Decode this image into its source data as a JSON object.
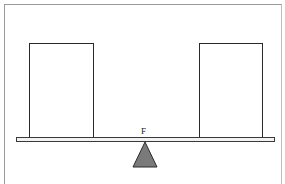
{
  "diagram": {
    "fulcrum_label": "F",
    "colors": {
      "background": "#ffffff",
      "outline": "#2a2a2a",
      "fulcrum_fill": "#7a7a7a",
      "beam_fill": "#f2f2f2",
      "frame": "#9a9a9a"
    },
    "elements": {
      "left_box": {
        "x": 29,
        "y": 43,
        "width": 65,
        "height": 94
      },
      "right_box": {
        "x": 199,
        "y": 43,
        "width": 64,
        "height": 94
      },
      "beam": {
        "x": 16,
        "y": 137,
        "width": 259,
        "height": 5
      },
      "fulcrum": {
        "apex": [
          145,
          142
        ],
        "base_left": [
          133,
          167
        ],
        "base_right": [
          157,
          167
        ]
      }
    }
  }
}
